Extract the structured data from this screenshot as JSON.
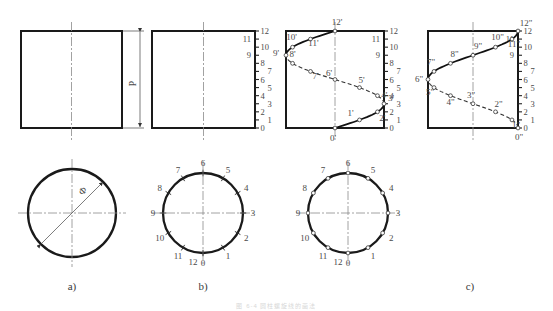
{
  "figure": {
    "bottom_caption": "图 6-4  圆柱螺旋线的画法",
    "stage_labels": [
      "a)",
      "b)",
      "c)"
    ],
    "pitch_label": "P",
    "diameter_label": "Ф"
  },
  "colors": {
    "line": "#1a1a1a",
    "thin": "#555555",
    "center": "#8a8a8a",
    "text": "#4a4a4a",
    "marker_fill": "#ffffff"
  },
  "scale_numbers": [
    "0",
    "1",
    "2",
    "3",
    "4",
    "5",
    "6",
    "7",
    "8",
    "9",
    "10",
    "11",
    "12"
  ],
  "panels": {
    "a": {
      "label": "a)",
      "front_view": {
        "name": "plain-rectangle",
        "has_scale": false,
        "has_curve": false
      },
      "plan_view": {
        "name": "plain-circle",
        "has_divisions": false,
        "diameter_arrow": true,
        "diameter_label": "Ф"
      }
    },
    "b": {
      "label": "b)",
      "front_view": {
        "name": "scaled-rectangle",
        "has_scale": true,
        "has_curve": false
      },
      "plan_view": {
        "name": "divided-circle",
        "has_divisions": true,
        "division_count": 12
      }
    },
    "c": {
      "label": "c)",
      "front_view_left": {
        "name": "helix-front-view",
        "has_scale": true,
        "has_curve": true,
        "prime": "'"
      },
      "front_view_right": {
        "name": "helix-side-view",
        "has_scale": true,
        "has_curve": true,
        "prime": "\""
      },
      "plan_view": {
        "name": "divided-circle",
        "has_divisions": true,
        "division_count": 12
      }
    }
  },
  "circle_point_labels": [
    "0",
    "1",
    "2",
    "3",
    "4",
    "5",
    "6",
    "7",
    "8",
    "9",
    "10",
    "11",
    "12"
  ],
  "helix_front_labels": [
    "0'",
    "1'",
    "2'",
    "3'",
    "4'",
    "5'",
    "6'",
    "7'",
    "8'",
    "9'",
    "10'",
    "11'",
    "12'"
  ],
  "helix_side_labels": [
    "0\"",
    "1\"",
    "2\"",
    "3\"",
    "4\"",
    "5\"",
    "6\"",
    "7\"",
    "8\"",
    "9\"",
    "10\"",
    "11\"",
    "12\""
  ]
}
